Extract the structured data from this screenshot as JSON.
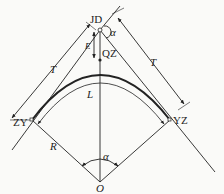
{
  "diagram": {
    "labels": {
      "jd": "JD",
      "qz": "QZ",
      "zy": "ZY",
      "yz": "YZ",
      "o": "O",
      "t_left": "T",
      "t_right": "T",
      "e": "E",
      "l": "L",
      "r": "R",
      "alpha_top": "α",
      "alpha_bottom": "α"
    },
    "points": {
      "JD": [
        100,
        30
      ],
      "QZ": [
        100,
        60
      ],
      "ZY": [
        32,
        120
      ],
      "YZ": [
        170,
        120
      ],
      "O": [
        100,
        182
      ]
    },
    "colors": {
      "line": "#222222",
      "background": "#fafaf8"
    }
  }
}
